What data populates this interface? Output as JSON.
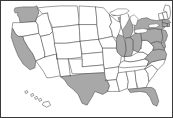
{
  "figure": {
    "kind": "choropleth-map",
    "caption": ""
  },
  "legend": {
    "selected_label": "Selected",
    "unselected_label": "Not selected"
  },
  "colors": {
    "selected_fill": "#a8a8a8",
    "unselected_fill": "#ffffff",
    "border_stroke": "#4a4a4a",
    "frame_stroke": "#3a3a3a",
    "background": "#ffffff"
  },
  "chart_data": {
    "type": "map",
    "region": "United States",
    "value_type": "binary",
    "values": {
      "selected": 1,
      "unselected": 0
    },
    "selected_states": [
      "WA",
      "CA",
      "TX",
      "IL",
      "IN",
      "MI",
      "OH",
      "PA",
      "NY",
      "NJ",
      "MD",
      "DE",
      "MA",
      "CT",
      "RI",
      "VA",
      "FL"
    ],
    "unselected_states": [
      "OR",
      "ID",
      "NV",
      "MT",
      "WY",
      "UT",
      "AZ",
      "CO",
      "NM",
      "ND",
      "SD",
      "NE",
      "KS",
      "OK",
      "MN",
      "IA",
      "MO",
      "AR",
      "LA",
      "WI",
      "KY",
      "TN",
      "MS",
      "AL",
      "GA",
      "SC",
      "NC",
      "WV",
      "VT",
      "NH",
      "ME",
      "HI",
      "AK"
    ],
    "insets": [
      "HI"
    ],
    "legend_position": "none",
    "grid": false
  },
  "states": [
    {
      "code": "WA",
      "name": "Washington",
      "selected": true,
      "d": "M13,9 L14,7 L22,6 L33,6 L36,5 L37,7 L38,12 L36,17 L35,21 L22,22 L19,22 L18,17 L16,14 L17,12 L14,12 Z"
    },
    {
      "code": "OR",
      "name": "Oregon",
      "selected": false,
      "d": "M12,22 L18,22 L35,21 L37,24 L38,33 L22,36 L17,36 L14,33 L11,27 Z"
    },
    {
      "code": "CA",
      "name": "California",
      "selected": true,
      "d": "M11,28 L14,33 L17,36 L22,36 L23,40 L27,47 L32,54 L35,61 L34,68 L29,70 L22,64 L17,56 L13,46 L10,37 Z"
    },
    {
      "code": "NV",
      "name": "Nevada",
      "selected": false,
      "d": "M22,36 L38,33 L40,36 L44,53 L44,57 L35,61 L32,54 L27,47 L23,40 Z"
    },
    {
      "code": "ID",
      "name": "Idaho",
      "selected": false,
      "d": "M36,17 L42,13 L47,12 L48,18 L50,24 L52,31 L49,34 L40,36 L38,33 L37,24 L35,21 Z"
    },
    {
      "code": "MT",
      "name": "Montana",
      "selected": false,
      "d": "M37,7 L46,6 L60,5 L77,5 L79,19 L79,24 L63,26 L52,27 L48,18 L47,12 L42,13 Z"
    },
    {
      "code": "WY",
      "name": "Wyoming",
      "selected": false,
      "d": "M52,27 L63,26 L79,24 L80,41 L66,43 L54,43 L52,31 Z"
    },
    {
      "code": "UT",
      "name": "Utah",
      "selected": false,
      "d": "M40,36 L49,34 L52,31 L54,43 L56,54 L44,57 L44,53 Z"
    },
    {
      "code": "AZ",
      "name": "Arizona",
      "selected": false,
      "d": "M44,57 L56,54 L58,66 L60,76 L50,78 L46,78 L43,72 L35,61 L44,57 Z"
    },
    {
      "code": "CO",
      "name": "Colorado",
      "selected": false,
      "d": "M54,43 L66,43 L80,41 L82,57 L68,59 L56,59 L56,54 Z"
    },
    {
      "code": "NM",
      "name": "New Mexico",
      "selected": false,
      "d": "M56,54 L56,59 L68,59 L70,76 L60,77 L60,76 L58,66 Z"
    },
    {
      "code": "ND",
      "name": "North Dakota",
      "selected": false,
      "d": "M79,19 L79,5 L96,6 L97,20 L97,24 L79,24 Z"
    },
    {
      "code": "SD",
      "name": "South Dakota",
      "selected": false,
      "d": "M79,24 L97,24 L99,39 L80,41 L79,24 Z"
    },
    {
      "code": "NE",
      "name": "Nebraska",
      "selected": false,
      "d": "M80,41 L99,39 L103,48 L103,52 L82,54 L80,41 Z"
    },
    {
      "code": "KS",
      "name": "Kansas",
      "selected": false,
      "d": "M82,54 L103,52 L104,65 L82,67 L82,57 Z"
    },
    {
      "code": "OK",
      "name": "Oklahoma",
      "selected": false,
      "d": "M68,59 L82,59 L82,67 L104,65 L105,73 L84,74 L72,74 L68,59 Z"
    },
    {
      "code": "TX",
      "name": "Texas",
      "selected": true,
      "d": "M70,76 L84,74 L105,73 L107,80 L110,86 L108,92 L103,95 L95,92 L92,98 L87,106 L82,104 L78,95 L73,90 L68,86 L64,80 L60,77 L70,76 Z"
    },
    {
      "code": "MN",
      "name": "Minnesota",
      "selected": false,
      "d": "M96,6 L104,7 L110,14 L112,22 L110,26 L112,30 L113,36 L99,39 L97,24 L97,20 Z"
    },
    {
      "code": "IA",
      "name": "Iowa",
      "selected": false,
      "d": "M99,39 L113,36 L117,42 L117,48 L103,48 Z"
    },
    {
      "code": "MO",
      "name": "Missouri",
      "selected": false,
      "d": "M103,48 L117,48 L118,52 L122,56 L121,63 L119,67 L105,69 L104,65 L103,52 Z"
    },
    {
      "code": "AR",
      "name": "Arkansas",
      "selected": false,
      "d": "M105,69 L119,67 L119,73 L117,80 L106,81 L105,73 Z"
    },
    {
      "code": "LA",
      "name": "Louisiana",
      "selected": false,
      "d": "M106,81 L117,80 L119,88 L120,92 L113,92 L108,92 L110,86 L107,80 Z"
    },
    {
      "code": "WI",
      "name": "Wisconsin",
      "selected": false,
      "d": "M110,14 L117,20 L122,22 L121,28 L119,34 L117,38 L113,36 L112,30 L110,26 L112,22 Z"
    },
    {
      "code": "IL",
      "name": "Illinois",
      "selected": true,
      "d": "M117,38 L119,34 L124,36 L126,42 L127,50 L125,57 L122,56 L118,52 L117,48 L117,42 Z"
    },
    {
      "code": "MI",
      "name": "Michigan",
      "selected": true,
      "d": "M119,17 L124,15 L129,14 L130,18 L133,22 L134,30 L131,37 L126,38 L124,36 L123,30 L121,23 Z M112,11 L119,9 L126,9 L127,12 L121,14 L114,15 Z"
    },
    {
      "code": "IN",
      "name": "Indiana",
      "selected": true,
      "d": "M126,38 L131,37 L134,40 L134,50 L132,56 L125,57 L127,50 L126,42 Z"
    },
    {
      "code": "OH",
      "name": "Ohio",
      "selected": true,
      "d": "M131,37 L136,33 L142,33 L143,40 L142,48 L139,52 L134,50 L134,40 Z"
    },
    {
      "code": "KY",
      "name": "Kentucky",
      "selected": false,
      "d": "M132,56 L139,52 L144,52 L149,55 L146,59 L138,61 L131,62 L125,61 L125,57 Z"
    },
    {
      "code": "TN",
      "name": "Tennessee",
      "selected": false,
      "d": "M125,61 L131,62 L138,61 L146,59 L150,61 L148,66 L124,68 L119,67 L121,63 Z"
    },
    {
      "code": "MS",
      "name": "Mississippi",
      "selected": false,
      "d": "M119,73 L127,72 L129,82 L128,89 L120,92 L119,88 L117,80 Z"
    },
    {
      "code": "AL",
      "name": "Alabama",
      "selected": false,
      "d": "M127,72 L136,71 L137,82 L138,89 L129,90 L128,89 L129,82 Z"
    },
    {
      "code": "GA",
      "name": "Georgia",
      "selected": false,
      "d": "M136,71 L146,69 L149,74 L150,82 L147,88 L139,89 L137,82 Z"
    },
    {
      "code": "FL",
      "name": "Florida",
      "selected": true,
      "d": "M139,89 L147,88 L153,88 L156,90 L158,95 L160,102 L158,107 L154,105 L151,98 L147,93 L141,92 L131,93 L129,90 Z"
    },
    {
      "code": "SC",
      "name": "South Carolina",
      "selected": false,
      "d": "M146,69 L153,65 L159,70 L154,77 L150,82 L149,74 Z"
    },
    {
      "code": "NC",
      "name": "North Carolina",
      "selected": false,
      "d": "M148,66 L153,62 L161,60 L167,59 L165,64 L159,70 L153,65 L146,69 Z"
    },
    {
      "code": "VA",
      "name": "Virginia",
      "selected": true,
      "d": "M149,55 L154,50 L160,49 L166,50 L168,54 L167,59 L161,60 L153,62 L148,66 L150,61 L146,59 Z"
    },
    {
      "code": "WV",
      "name": "West Virginia",
      "selected": false,
      "d": "M142,48 L143,40 L148,40 L152,43 L155,47 L154,50 L149,55 L144,52 L139,52 L142,48 Z"
    },
    {
      "code": "MD",
      "name": "Maryland",
      "selected": true,
      "d": "M152,43 L158,41 L163,43 L166,45 L166,50 L160,49 L154,50 L155,47 Z"
    },
    {
      "code": "DE",
      "name": "Delaware",
      "selected": true,
      "d": "M163,42 L166,42 L167,47 L165,48 L163,44 Z"
    },
    {
      "code": "PA",
      "name": "Pennsylvania",
      "selected": true,
      "d": "M142,33 L144,29 L156,28 L163,29 L164,36 L163,42 L158,41 L152,43 L148,40 L143,40 Z"
    },
    {
      "code": "NJ",
      "name": "New Jersey",
      "selected": true,
      "d": "M163,29 L167,30 L169,35 L167,41 L164,41 L164,36 Z"
    },
    {
      "code": "NY",
      "name": "New York",
      "selected": true,
      "d": "M136,22 L142,18 L148,17 L152,19 L158,20 L164,19 L168,22 L166,27 L163,29 L156,28 L144,29 L142,33 L136,33 L135,27 Z"
    },
    {
      "code": "VT",
      "name": "Vermont",
      "selected": false,
      "d": "M160,13 L164,12 L166,18 L164,19 L161,19 Z"
    },
    {
      "code": "NH",
      "name": "New Hampshire",
      "selected": false,
      "d": "M164,12 L168,11 L170,18 L166,19 Z"
    },
    {
      "code": "ME",
      "name": "Maine",
      "selected": false,
      "d": "M167,4 L171,5 L172,12 L171,18 L169,17 L168,11 L165,10 Z"
    },
    {
      "code": "MA",
      "name": "Massachusetts",
      "selected": true,
      "d": "M164,19 L170,19 L172,22 L168,23 L164,22 Z"
    },
    {
      "code": "CT",
      "name": "Connecticut",
      "selected": true,
      "d": "M164,22 L169,23 L169,26 L164,26 Z"
    },
    {
      "code": "RI",
      "name": "Rhode Island",
      "selected": true,
      "d": "M169,23 L171,23 L171,26 L169,26 Z"
    },
    {
      "code": "HI",
      "name": "Hawaii",
      "selected": false,
      "d": "M24,92 L26,91 L27,93 L25,94 Z M30,95 L32,94 L33,96 L31,97 Z M34,98 L36,97 L37,99 L35,100 Z M38,100 L40,99 L41,101 L39,102 Z M43,103 L48,102 L50,106 L46,108 L42,106 Z"
    }
  ],
  "lakes": [
    {
      "name": "Lake Michigan",
      "d": "M121,14 L127,12 L129,14 L130,18 L127,24 L123,30 L121,23 Z"
    },
    {
      "name": "Lake Superior",
      "d": "M110,12 L118,8 L127,8 L130,10 L126,13 L118,15 L112,14 Z"
    },
    {
      "name": "Lake Huron",
      "d": "M131,16 L135,14 L139,18 L137,25 L133,24 L131,19 Z"
    },
    {
      "name": "Lake Erie",
      "d": "M136,29 L144,28 L149,29 L147,32 L139,33 L135,32 Z"
    },
    {
      "name": "Lake Ontario",
      "d": "M150,24 L158,23 L161,25 L157,27 L150,27 Z"
    }
  ]
}
